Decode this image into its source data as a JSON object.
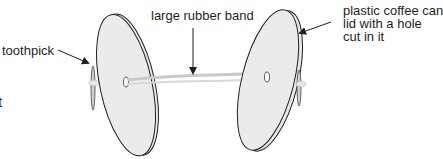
{
  "diagram": {
    "labels": {
      "toothpick": "toothpick",
      "rubber_band": "large rubber band",
      "lid_line1": "plastic coffee can",
      "lid_line2": "lid with a hole",
      "lid_line3": "cut in it",
      "cropped_fragment": "t"
    },
    "parts": [
      "left-lid",
      "right-lid",
      "rubber-band",
      "left-toothpick",
      "right-toothpick"
    ]
  }
}
